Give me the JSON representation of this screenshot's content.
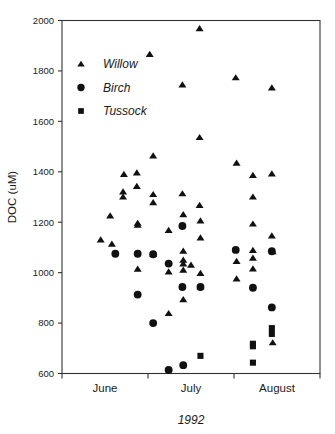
{
  "chart_data": {
    "type": "scatter",
    "title": "",
    "xlabel": "1992",
    "ylabel": "DOC (uM)",
    "ylim": [
      600,
      2000
    ],
    "xlim": [
      0,
      3
    ],
    "grid": false,
    "legend_position": "top-left",
    "y_ticks": [
      2000,
      1800,
      1600,
      1400,
      1200,
      1000,
      800,
      600
    ],
    "x_tick_labels": [
      "June",
      "July",
      "August"
    ],
    "x_tick_positions": [
      0.5,
      1.5,
      2.5
    ],
    "x_axis_note": "Month tick marks bracket each month; June spans 0-1, July 1-2, August 2-3",
    "series": [
      {
        "name": "Willow",
        "marker": "triangle",
        "color": "#111111",
        "points": [
          [
            0.56,
            1225
          ],
          [
            0.45,
            1130
          ],
          [
            0.58,
            1113
          ],
          [
            0.72,
            1390
          ],
          [
            0.71,
            1320
          ],
          [
            0.71,
            1300
          ],
          [
            0.87,
            1396
          ],
          [
            0.87,
            1342
          ],
          [
            0.88,
            1196
          ],
          [
            0.88,
            1188
          ],
          [
            0.88,
            1014
          ],
          [
            1.02,
            1866
          ],
          [
            1.06,
            1463
          ],
          [
            1.06,
            1310
          ],
          [
            1.06,
            1278
          ],
          [
            1.06,
            1072
          ],
          [
            1.24,
            1168
          ],
          [
            1.24,
            1003
          ],
          [
            1.24,
            838
          ],
          [
            1.4,
            1745
          ],
          [
            1.4,
            1313
          ],
          [
            1.41,
            1230
          ],
          [
            1.41,
            1085
          ],
          [
            1.41,
            1050
          ],
          [
            1.41,
            1035
          ],
          [
            1.41,
            1010
          ],
          [
            1.41,
            893
          ],
          [
            1.6,
            1968
          ],
          [
            1.6,
            1536
          ],
          [
            1.6,
            1267
          ],
          [
            1.61,
            1205
          ],
          [
            1.61,
            1138
          ],
          [
            1.61,
            997
          ],
          [
            1.61,
            943
          ],
          [
            1.5,
            1030
          ],
          [
            2.02,
            1773
          ],
          [
            2.03,
            1434
          ],
          [
            2.03,
            1045
          ],
          [
            2.03,
            975
          ],
          [
            2.22,
            1386
          ],
          [
            2.22,
            1300
          ],
          [
            2.22,
            1193
          ],
          [
            2.22,
            1088
          ],
          [
            2.22,
            1058
          ],
          [
            2.22,
            1015
          ],
          [
            2.44,
            1733
          ],
          [
            2.44,
            1392
          ],
          [
            2.44,
            1146
          ],
          [
            2.45,
            1083
          ],
          [
            2.45,
            722
          ]
        ]
      },
      {
        "name": "Birch",
        "marker": "circle",
        "color": "#111111",
        "points": [
          [
            0.62,
            1075
          ],
          [
            0.88,
            1075
          ],
          [
            0.88,
            913
          ],
          [
            1.06,
            1073
          ],
          [
            1.06,
            800
          ],
          [
            1.24,
            1036
          ],
          [
            1.24,
            614
          ],
          [
            1.4,
            1185
          ],
          [
            1.4,
            943
          ],
          [
            1.41,
            633
          ],
          [
            1.61,
            943
          ],
          [
            2.02,
            1090
          ],
          [
            2.22,
            940
          ],
          [
            2.44,
            1085
          ],
          [
            2.44,
            862
          ]
        ]
      },
      {
        "name": "Tussock",
        "marker": "square",
        "color": "#111111",
        "points": [
          [
            1.61,
            670
          ],
          [
            2.22,
            718
          ],
          [
            2.22,
            708
          ],
          [
            2.22,
            643
          ],
          [
            2.44,
            780
          ],
          [
            2.44,
            757
          ]
        ]
      }
    ]
  },
  "legend": {
    "entries": [
      {
        "label": "Willow",
        "marker": "triangle"
      },
      {
        "label": "Birch",
        "marker": "circle"
      },
      {
        "label": "Tussock",
        "marker": "square"
      }
    ]
  },
  "axes": {
    "y_title": "DOC (uM)",
    "x_title": "1992"
  }
}
